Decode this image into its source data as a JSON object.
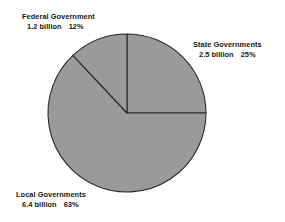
{
  "chart_data": {
    "type": "pie",
    "title": "",
    "subtitle": "",
    "xlabel": "",
    "ylabel": "",
    "legend_position": "none",
    "grid": false,
    "units": "billion",
    "total_percent": 100,
    "start_angle_deg": 0,
    "direction": "clockwise",
    "categories": [
      "State Governments",
      "Local Governments",
      "Federal Government"
    ],
    "values": [
      2.5,
      6.4,
      1.2
    ],
    "percents": [
      25,
      63,
      12
    ],
    "slice_color": "#9a9a9a",
    "slice_outline_color": "#2a2a2a",
    "background_color": "#ffffff",
    "geometry": {
      "center_x": 127,
      "center_y": 113,
      "radius": 79
    },
    "slices": [
      {
        "name": "State Governments",
        "value": 2.5,
        "percent": 25,
        "start_deg": 0,
        "end_deg": 90,
        "color": "#9a9a9a"
      },
      {
        "name": "Local Governments",
        "value": 6.4,
        "percent": 63,
        "start_deg": 90,
        "end_deg": 316.8,
        "color": "#9a9a9a"
      },
      {
        "name": "Federal Government",
        "value": 1.2,
        "percent": 12,
        "start_deg": 316.8,
        "end_deg": 360,
        "color": "#9a9a9a"
      }
    ]
  },
  "labels": {
    "federal": {
      "title": "Federal Government",
      "amount": "1.2 billion",
      "percent": "12%"
    },
    "state": {
      "title": "State Governments",
      "amount": "2.5 billion",
      "percent": "25%"
    },
    "local": {
      "title": "Local Governments",
      "amount": "6.4 billion",
      "percent": "63%"
    }
  }
}
